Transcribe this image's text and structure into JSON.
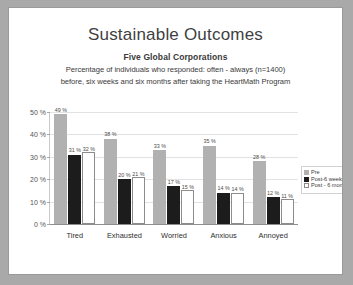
{
  "slide": {
    "title": "Sustainable Outcomes",
    "subtitle_bold": "Five Global Corporations",
    "subtitle_line1": "Percentage of individuals who responded: often - always (n=1400)",
    "subtitle_line2": "before, six weeks and six months after taking the HeartMath Program"
  },
  "chart_data": {
    "type": "bar",
    "title": "Sustainable Outcomes",
    "subtitle": "Five Global Corporations",
    "xlabel": "",
    "ylabel": "",
    "ylim": [
      0,
      50
    ],
    "grid": true,
    "legend_position": "right",
    "categories": [
      "Tired",
      "Exhausted",
      "Worried",
      "Anxious",
      "Annoyed"
    ],
    "ytick_labels": [
      "0 %",
      "10 %",
      "20 %",
      "30 %",
      "40 %",
      "50 %"
    ],
    "ytick_values": [
      0,
      10,
      20,
      30,
      40,
      50
    ],
    "series": [
      {
        "name": "Pre",
        "color": "#b1b1b1",
        "values": [
          49,
          38,
          33,
          35,
          28
        ],
        "labels": [
          "49 %",
          "38 %",
          "33 %",
          "35 %",
          "28 %"
        ]
      },
      {
        "name": "Post-6 weeks",
        "color": "#1c1c1c",
        "values": [
          31,
          20,
          17,
          14,
          12
        ],
        "labels": [
          "31 %",
          "20 %",
          "17 %",
          "14 %",
          "12 %"
        ]
      },
      {
        "name": "Post - 6 months",
        "color": "#ffffff",
        "values": [
          32,
          21,
          15,
          14,
          11
        ],
        "labels": [
          "32 %",
          "21 %",
          "15 %",
          "14 %",
          "11 %"
        ]
      }
    ]
  }
}
